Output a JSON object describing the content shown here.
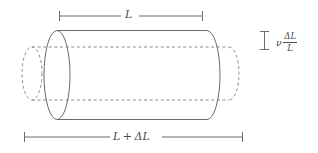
{
  "figure": {
    "background_color": "#ffffff",
    "line_color": "#6b6b6b",
    "dashed_line_color": "#8a8a8a",
    "text_color": "#4a4a4a",
    "width": 318,
    "height": 153
  },
  "dimensions": {
    "top": {
      "label": "L",
      "description": "original length dimension line",
      "x_start": 59,
      "x_end": 203,
      "y": 16
    },
    "bottom": {
      "label_parts": {
        "first": "L",
        "operator": "+",
        "second": "ΔL"
      },
      "label": "L + ΔL",
      "description": "stretched length dimension line",
      "x_start": 24,
      "x_end": 243,
      "y": 137
    },
    "transverse": {
      "symbol": "ν",
      "numerator": "ΔL",
      "denominator": "L",
      "label": "ν ΔL/L",
      "description": "lateral contraction magnitude",
      "bar_x": 264,
      "bar_y_top": 31,
      "bar_y_bottom": 50
    }
  },
  "shapes": {
    "original_cylinder": {
      "style": "dashed",
      "description": "undeformed cylinder outline",
      "left_cap_cx": 32,
      "right_cap_cx": 229,
      "cy": 73.5,
      "rx": 10,
      "ry": 26.5
    },
    "deformed_cylinder": {
      "style": "solid",
      "description": "stretched and laterally contracted cylinder",
      "left_cap_cx": 57,
      "right_cap_cx": 207,
      "cy": 75,
      "rx": 13,
      "ry": 44.5
    }
  }
}
